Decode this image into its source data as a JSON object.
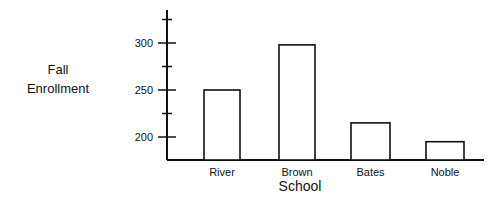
{
  "chart_data": {
    "type": "bar",
    "title": "",
    "xlabel": "School",
    "ylabel": "Fall Enrollment",
    "ylabel_lines": [
      "Fall",
      "Enrollment"
    ],
    "categories": [
      "River",
      "Brown",
      "Bates",
      "Noble"
    ],
    "values": [
      250,
      298,
      215,
      195
    ],
    "ylim": [
      175,
      335
    ],
    "yticks": [
      200,
      250,
      300
    ],
    "minor_yticks": [
      225,
      275,
      325
    ],
    "grid": false,
    "legend": null,
    "bar_fill": "#ffffff",
    "bar_stroke": "#111111"
  }
}
